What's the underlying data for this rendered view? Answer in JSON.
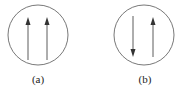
{
  "diagrams": [
    {
      "label": "(a)",
      "arrows": [
        "up",
        "up"
      ]
    },
    {
      "label": "(b)",
      "arrows": [
        "down",
        "up"
      ]
    }
  ],
  "colors": {
    "stroke": "#333333"
  }
}
